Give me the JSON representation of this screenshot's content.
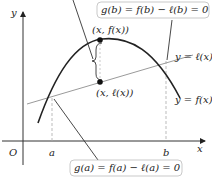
{
  "diagram": {
    "axes": {
      "x_label": "x",
      "y_label": "y",
      "origin_label": "O",
      "a_label": "a",
      "b_label": "b"
    },
    "curves": {
      "f_label": "y = f(x)",
      "line_label": "y = ℓ(x)"
    },
    "points": {
      "upper": "(x, f(x))",
      "lower": "(x, ℓ(x))"
    },
    "callouts": {
      "gb": "g(b) = f(b) − ℓ(b) = 0",
      "ga": "g(a) = f(a) − ℓ(a) = 0"
    },
    "colors": {
      "curve": "#222222",
      "secant": "#9a9a9a",
      "axes": "#333333",
      "dashed": "#aaaaaa",
      "box_border": "#bbbbbb"
    }
  }
}
